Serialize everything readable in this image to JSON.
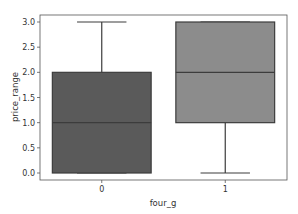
{
  "chart_data": {
    "type": "box",
    "title": "",
    "xlabel": "four_g",
    "ylabel": "price_range",
    "categories": [
      "0",
      "1"
    ],
    "ylim": [
      -0.1,
      3.15
    ],
    "yticks": [
      "0.0",
      "0.5",
      "1.0",
      "1.5",
      "2.0",
      "2.5",
      "3.0"
    ],
    "ytick_values": [
      0.0,
      0.5,
      1.0,
      1.5,
      2.0,
      2.5,
      3.0
    ],
    "grid": false,
    "legend": null,
    "series": [
      {
        "name": "0",
        "min": 0.0,
        "q1": 0.0,
        "median": 1.0,
        "q3": 2.0,
        "max": 3.0,
        "color": "#5a5a5a"
      },
      {
        "name": "1",
        "min": 0.0,
        "q1": 1.0,
        "median": 2.0,
        "q3": 3.0,
        "max": 3.0,
        "color": "#8c8c8c"
      }
    ]
  }
}
